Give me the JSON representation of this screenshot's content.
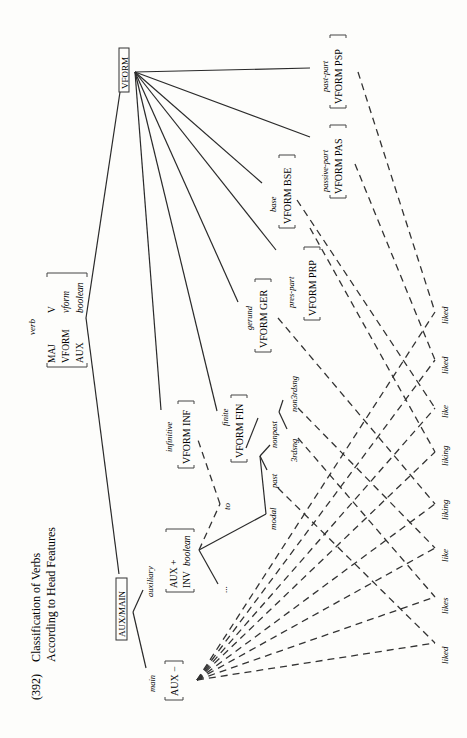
{
  "figure": {
    "number": "(392)",
    "title_line1": "Classification of Verbs",
    "title_line2": "According to Head Features"
  },
  "root": {
    "type": "verb",
    "avm": [
      {
        "feature": "MAJ",
        "value": "V"
      },
      {
        "feature": "VFORM",
        "value": "vform"
      },
      {
        "feature": "AUX",
        "value": "boolean"
      }
    ]
  },
  "partitions": {
    "aux_main": "AUX/MAIN",
    "vform": "VFORM"
  },
  "aux_main_branches": {
    "main": {
      "label": "main",
      "avm": "AUX −"
    },
    "auxiliary": {
      "label": "auxiliary",
      "avm_row1": "AUX +",
      "avm_row2_feature": "INV",
      "avm_row2_value": "boolean"
    },
    "aux_children": {
      "to": "to",
      "modal": "modal",
      "ellipsis": "..."
    }
  },
  "vform_branches": {
    "infinitive": {
      "label": "infinitive",
      "avm": "VFORM INF"
    },
    "finite": {
      "label": "finite",
      "avm": "VFORM FIN",
      "children": {
        "past": "past",
        "nonpast": "nonpast",
        "nonpast_children": {
          "third": "3rdsng",
          "nonthird": "non3rdsng"
        }
      }
    },
    "gerund": {
      "label": "gerund",
      "avm": "VFORM GER"
    },
    "pres_part": {
      "label": "pres-part",
      "avm": "VFORM PRP"
    },
    "base": {
      "label": "base",
      "avm": "VFORM BSE"
    },
    "passive_part": {
      "label": "passive-part",
      "avm": "VFORM PAS"
    },
    "past_part": {
      "label": "past-part",
      "avm": "VFORM PSP"
    }
  },
  "leaves": [
    "liked",
    "likes",
    "like",
    "liking",
    "liking",
    "like",
    "liked",
    "liked"
  ]
}
